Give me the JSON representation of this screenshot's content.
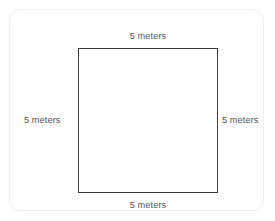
{
  "figure": {
    "type": "geometry-diagram",
    "shape_name": "square",
    "colors": {
      "page_background": "#ffffff",
      "card_background": "#fefefe",
      "card_border": "#efefef",
      "shape_stroke": "#3c3c3c",
      "shape_fill": "#ffffff",
      "label_text": "#555555"
    },
    "labels": {
      "top": "5 meters",
      "right": "5 meters",
      "bottom": "5 meters",
      "left": "5 meters"
    }
  }
}
